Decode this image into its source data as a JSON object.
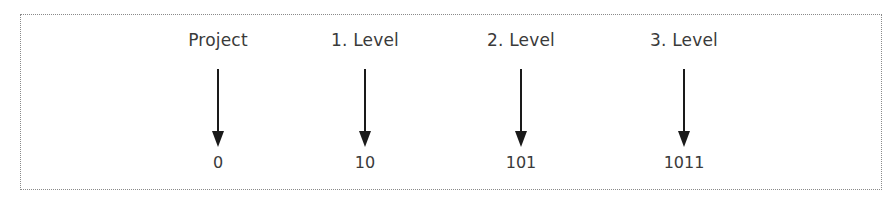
{
  "diagram": {
    "columns": [
      {
        "label": "Project",
        "value": "0",
        "x": 218
      },
      {
        "label": "1. Level",
        "value": "10",
        "x": 365
      },
      {
        "label": "2. Level",
        "value": "101",
        "x": 521
      },
      {
        "label": "3. Level",
        "value": "1011",
        "x": 684
      }
    ],
    "arrow_color": "#1a1a1a",
    "border_color": "#8a8a8a"
  }
}
